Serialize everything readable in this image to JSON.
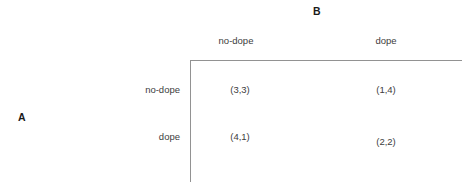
{
  "figure": {
    "row_player_label": "A",
    "column_player_label": "B",
    "line_color": "#929292",
    "text_color": "#3d3d3d",
    "label_color": "#1a1a1a"
  },
  "chart_data": {
    "type": "table",
    "title": "",
    "xlabel": "B",
    "ylabel": "A",
    "categories": [
      "no-dope",
      "dope"
    ],
    "column_headers": [
      "no-dope",
      "dope"
    ],
    "row_headers": [
      "no-dope",
      "dope"
    ],
    "cells": [
      [
        {
          "text": "(3,3)",
          "row_payoff": 3,
          "column_payoff": 3
        },
        {
          "text": "(1,4)",
          "row_payoff": 1,
          "column_payoff": 4
        }
      ],
      [
        {
          "text": "(4,1)",
          "row_payoff": 4,
          "column_payoff": 1
        },
        {
          "text": "(2,2)",
          "row_payoff": 2,
          "column_payoff": 2
        }
      ]
    ],
    "grid": false,
    "legend": "none"
  }
}
